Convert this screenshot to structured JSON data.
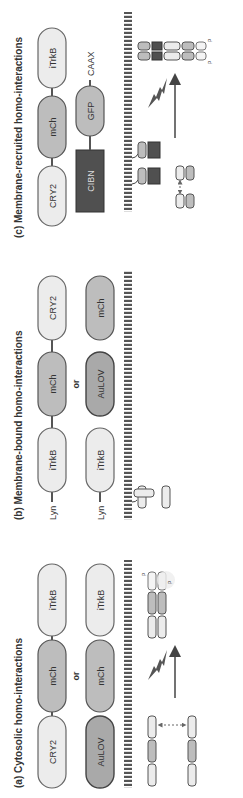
{
  "colors": {
    "light": "#ececec",
    "mid": "#bdbdbd",
    "dark_block": "#555555",
    "outline": "#555555",
    "arrow": "#444444",
    "membrane": "#555555"
  },
  "panels": [
    {
      "title": "(a) Cytosolic homo-interactions",
      "constructs": [
        {
          "domains": [
            "CRY2",
            "mCh",
            "iTrkB"
          ]
        },
        {
          "domains": [
            "AuLOV",
            "mCh",
            "iTrkB"
          ]
        }
      ],
      "or_label": "or",
      "phospho_labels": [
        "P",
        "P"
      ]
    },
    {
      "title": "(b) Membrane-bound homo-interactions",
      "constructs": [
        {
          "anchor": "Lyn",
          "domains": [
            "iTrkB",
            "mCh",
            "CRY2"
          ]
        },
        {
          "anchor": "Lyn",
          "domains": [
            "iTrkB",
            "AuLOV",
            "mCh"
          ]
        }
      ],
      "or_label": "or",
      "phospho_labels": [
        "P",
        "P"
      ]
    },
    {
      "title": "(c) Membrane-recruited homo-interactions",
      "constructs": [
        {
          "domains": [
            "CRY2",
            "mCh",
            "iTrkB"
          ]
        },
        {
          "domains": [
            "CIBN",
            "GFP"
          ],
          "anchor": "CAAX"
        }
      ],
      "phospho_labels": [
        "P",
        "P"
      ]
    }
  ]
}
